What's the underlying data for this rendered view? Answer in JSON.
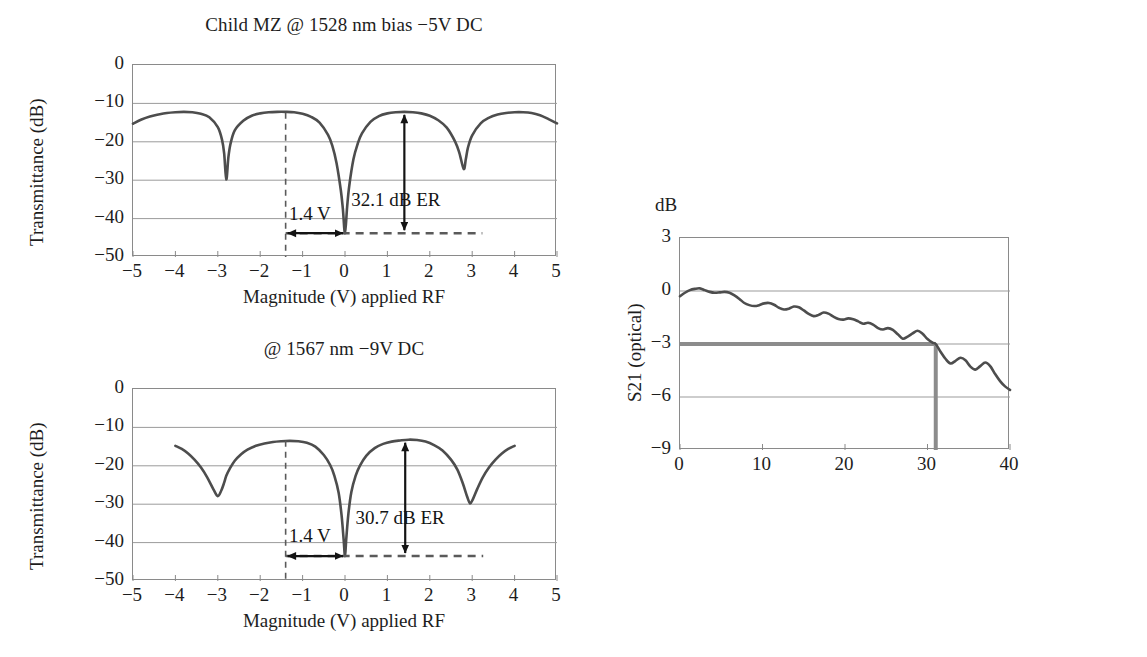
{
  "figure": {
    "panels": [
      "mz-1528",
      "mz-1567",
      "s21"
    ]
  },
  "chart_data": [
    {
      "id": "mz-1528",
      "type": "line",
      "title": "Child MZ @ 1528 nm bias −5V DC",
      "xlabel": "Magnitude (V) applied RF",
      "ylabel": "Transmittance (dB)",
      "xlim": [
        -5,
        5
      ],
      "ylim": [
        -50,
        0
      ],
      "xticks": [
        -5,
        -4,
        -3,
        -2,
        -1,
        0,
        1,
        2,
        3,
        4,
        5
      ],
      "xticklabels": [
        "−5",
        "−4",
        "−3",
        "−2",
        "−1",
        "0",
        "1",
        "2",
        "3",
        "4",
        "5"
      ],
      "yticks": [
        0,
        -10,
        -20,
        -30,
        -40,
        -50
      ],
      "yticklabels": [
        "0",
        "−10",
        "−20",
        "−30",
        "−40",
        "−50"
      ],
      "grid": true,
      "x": [
        -5.0,
        -4.8,
        -4.6,
        -4.4,
        -4.2,
        -4.0,
        -3.8,
        -3.6,
        -3.4,
        -3.2,
        -3.0,
        -2.9,
        -2.85,
        -2.8,
        -2.75,
        -2.7,
        -2.6,
        -2.4,
        -2.2,
        -2.0,
        -1.8,
        -1.6,
        -1.4,
        -1.2,
        -1.0,
        -0.8,
        -0.6,
        -0.4,
        -0.3,
        -0.2,
        -0.1,
        -0.05,
        0.0,
        0.05,
        0.1,
        0.2,
        0.3,
        0.4,
        0.6,
        0.8,
        1.0,
        1.2,
        1.4,
        1.6,
        1.8,
        2.0,
        2.2,
        2.4,
        2.6,
        2.7,
        2.8,
        2.85,
        2.9,
        3.0,
        3.2,
        3.4,
        3.6,
        3.8,
        4.0,
        4.2,
        4.4,
        4.6,
        4.8,
        5.0
      ],
      "y": [
        -15.3,
        -14.2,
        -13.4,
        -12.9,
        -12.5,
        -12.3,
        -12.2,
        -12.3,
        -12.7,
        -13.6,
        -16.2,
        -19.5,
        -23.0,
        -29.8,
        -24.0,
        -20.5,
        -17.0,
        -14.5,
        -13.2,
        -12.6,
        -12.3,
        -12.2,
        -12.2,
        -12.3,
        -12.7,
        -13.5,
        -15.0,
        -18.2,
        -21.0,
        -25.5,
        -32.5,
        -37.5,
        -43.8,
        -37.0,
        -31.5,
        -24.5,
        -20.5,
        -17.8,
        -14.8,
        -13.3,
        -12.6,
        -12.3,
        -12.2,
        -12.3,
        -12.6,
        -13.2,
        -14.4,
        -16.3,
        -20.0,
        -23.0,
        -27.1,
        -24.5,
        -21.5,
        -18.3,
        -15.2,
        -13.7,
        -12.9,
        -12.5,
        -12.3,
        -12.3,
        -12.5,
        -13.1,
        -14.1,
        -15.2
      ],
      "annotations": [
        {
          "name": "er-label",
          "text": "32.1 dB ER",
          "x": 1.35,
          "y": -36.0
        },
        {
          "name": "vpi-label",
          "text": "1.4 V",
          "x": -0.78,
          "y": -39.5
        },
        {
          "name": "vpi-marker-x",
          "value": -1.4
        },
        {
          "name": "er-arrow-x",
          "value": 1.4
        },
        {
          "name": "er-arrow-top",
          "value": -12.2
        },
        {
          "name": "er-arrow-bottom",
          "value": -43.8
        },
        {
          "name": "baseline-y",
          "value": -43.8
        }
      ]
    },
    {
      "id": "mz-1567",
      "type": "line",
      "title": "@ 1567 nm −9V DC",
      "xlabel": "Magnitude (V) applied RF",
      "ylabel": "Transmittance (dB)",
      "xlim": [
        -5,
        5
      ],
      "ylim": [
        -50,
        0
      ],
      "xticks": [
        -5,
        -4,
        -3,
        -2,
        -1,
        0,
        1,
        2,
        3,
        4,
        5
      ],
      "xticklabels": [
        "−5",
        "−4",
        "−3",
        "−2",
        "−1",
        "0",
        "1",
        "2",
        "3",
        "4",
        "5"
      ],
      "yticks": [
        0,
        -10,
        -20,
        -30,
        -40,
        -50
      ],
      "yticklabels": [
        "0",
        "−10",
        "−20",
        "−30",
        "−40",
        "−50"
      ],
      "grid": true,
      "x": [
        -4.0,
        -3.85,
        -3.7,
        -3.55,
        -3.4,
        -3.25,
        -3.1,
        -3.0,
        -2.92,
        -2.85,
        -2.8,
        -2.72,
        -2.6,
        -2.45,
        -2.3,
        -2.1,
        -1.9,
        -1.7,
        -1.5,
        -1.3,
        -1.1,
        -0.9,
        -0.7,
        -0.5,
        -0.35,
        -0.25,
        -0.15,
        -0.08,
        -0.03,
        0.0,
        0.03,
        0.08,
        0.15,
        0.25,
        0.35,
        0.5,
        0.7,
        0.9,
        1.1,
        1.3,
        1.5,
        1.7,
        1.9,
        2.1,
        2.3,
        2.5,
        2.65,
        2.78,
        2.88,
        2.95,
        3.02,
        3.12,
        3.25,
        3.4,
        3.55,
        3.7,
        3.85,
        4.0
      ],
      "y": [
        -14.8,
        -15.6,
        -16.8,
        -18.4,
        -20.4,
        -23.0,
        -26.2,
        -27.9,
        -26.5,
        -24.4,
        -22.6,
        -20.8,
        -18.7,
        -17.0,
        -15.8,
        -14.8,
        -14.2,
        -13.8,
        -13.6,
        -13.5,
        -13.6,
        -14.0,
        -15.0,
        -17.2,
        -19.8,
        -22.6,
        -27.0,
        -33.0,
        -39.5,
        -43.5,
        -39.0,
        -32.5,
        -26.8,
        -22.6,
        -20.0,
        -17.4,
        -15.4,
        -14.3,
        -13.7,
        -13.4,
        -13.2,
        -13.3,
        -13.7,
        -14.6,
        -16.0,
        -18.4,
        -21.0,
        -24.6,
        -28.0,
        -29.8,
        -28.6,
        -26.0,
        -23.0,
        -20.4,
        -18.4,
        -16.8,
        -15.6,
        -14.8
      ],
      "annotations": [
        {
          "name": "er-label",
          "text": "30.7 dB ER",
          "x": 1.45,
          "y": -34.5
        },
        {
          "name": "vpi-label",
          "text": "1.4 V",
          "x": -0.78,
          "y": -39.0
        },
        {
          "name": "vpi-marker-x",
          "value": -1.4
        },
        {
          "name": "er-arrow-x",
          "value": 1.42
        },
        {
          "name": "er-arrow-top",
          "value": -13.2
        },
        {
          "name": "er-arrow-bottom",
          "value": -43.5
        },
        {
          "name": "baseline-y",
          "value": -43.5
        }
      ]
    },
    {
      "id": "s21",
      "type": "line",
      "title": "",
      "unit_label": "dB",
      "xlabel": "Frequency (GHz)",
      "ylabel": "S21 (optical)",
      "xlim": [
        0,
        40
      ],
      "ylim": [
        -9,
        3
      ],
      "xticks": [
        0,
        10,
        20,
        30,
        40
      ],
      "xticklabels": [
        "0",
        "10",
        "20",
        "30",
        "40"
      ],
      "yticks": [
        3,
        0,
        -3,
        -6,
        -9
      ],
      "yticklabels": [
        "3",
        "0",
        "−3",
        "−6",
        "−9"
      ],
      "grid": true,
      "x": [
        0.0,
        0.6,
        1.2,
        1.8,
        2.4,
        3.0,
        3.6,
        4.2,
        4.8,
        5.4,
        6.0,
        6.6,
        7.2,
        7.8,
        8.4,
        9.0,
        9.6,
        10.2,
        10.8,
        11.4,
        12.0,
        12.6,
        13.2,
        13.8,
        14.4,
        15.0,
        15.6,
        16.2,
        16.8,
        17.4,
        18.0,
        18.6,
        19.2,
        19.8,
        20.4,
        21.0,
        21.6,
        22.2,
        22.8,
        23.4,
        24.0,
        24.6,
        25.2,
        25.8,
        26.4,
        27.0,
        27.6,
        28.2,
        28.8,
        29.4,
        30.0,
        30.6,
        31.0,
        31.6,
        32.2,
        32.8,
        33.4,
        34.0,
        34.6,
        35.2,
        35.8,
        36.4,
        37.0,
        37.6,
        38.2,
        38.8,
        39.4,
        40.0
      ],
      "y": [
        -0.3,
        -0.1,
        0.05,
        0.12,
        0.15,
        0.05,
        -0.05,
        -0.1,
        -0.08,
        -0.05,
        -0.1,
        -0.25,
        -0.45,
        -0.68,
        -0.8,
        -0.85,
        -0.8,
        -0.7,
        -0.68,
        -0.78,
        -0.95,
        -1.05,
        -1.0,
        -0.88,
        -0.92,
        -1.1,
        -1.3,
        -1.42,
        -1.35,
        -1.22,
        -1.28,
        -1.45,
        -1.58,
        -1.62,
        -1.55,
        -1.6,
        -1.72,
        -1.85,
        -1.8,
        -1.9,
        -2.1,
        -2.18,
        -2.1,
        -2.2,
        -2.45,
        -2.7,
        -2.58,
        -2.4,
        -2.25,
        -2.42,
        -2.72,
        -2.92,
        -3.0,
        -3.45,
        -3.85,
        -4.1,
        -3.95,
        -3.78,
        -3.92,
        -4.28,
        -4.45,
        -4.25,
        -4.05,
        -4.25,
        -4.7,
        -5.1,
        -5.4,
        -5.6
      ],
      "annotations": [
        {
          "name": "bandwidth-reference-line",
          "text": "",
          "y": -3.0
        },
        {
          "name": "bandwidth-marker-line",
          "text": "",
          "x": 31.0
        }
      ]
    }
  ]
}
